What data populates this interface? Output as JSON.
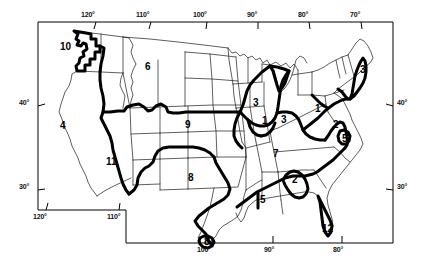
{
  "figure": {
    "kind": "map",
    "projection_note": "conic",
    "colors": {
      "background": "#ffffff",
      "state_outline": "#000000",
      "region_boundary": "#000000",
      "frame": "#000000",
      "text": "#000000"
    }
  },
  "axes": {
    "top_longitude": [
      {
        "label": "120°",
        "x": 92
      },
      {
        "label": "110°",
        "x": 147
      },
      {
        "label": "100°",
        "x": 204
      },
      {
        "label": "90°",
        "x": 254
      },
      {
        "label": "80°",
        "x": 305
      },
      {
        "label": "70°",
        "x": 357
      }
    ],
    "bottom_longitude_upper": [
      {
        "label": "120°",
        "x": 39
      },
      {
        "label": "110°",
        "x": 113
      }
    ],
    "bottom_longitude_lower": [
      {
        "label": "100°",
        "x": 204
      },
      {
        "label": "90°",
        "x": 268
      },
      {
        "label": "80°",
        "x": 337
      }
    ],
    "left_latitude": [
      {
        "label": "40°",
        "y": 103
      },
      {
        "label": "30°",
        "y": 187
      }
    ],
    "right_latitude": [
      {
        "label": "40°",
        "y": 103
      },
      {
        "label": "30°",
        "y": 187
      }
    ]
  },
  "regions": [
    {
      "id": "r10",
      "label": "10",
      "x": 64,
      "y": 48,
      "area": "pacific-northwest"
    },
    {
      "id": "r6",
      "label": "6",
      "x": 148,
      "y": 68,
      "area": "northern-rockies-plains"
    },
    {
      "id": "r4",
      "label": "4",
      "x": 63,
      "y": 127,
      "area": "california-nevada"
    },
    {
      "id": "r11",
      "label": "11",
      "x": 111,
      "y": 163,
      "area": "southwest"
    },
    {
      "id": "r9",
      "label": "9",
      "x": 188,
      "y": 126,
      "area": "central-plains"
    },
    {
      "id": "r8a",
      "label": "8",
      "x": 191,
      "y": 179,
      "area": "southern-plains"
    },
    {
      "id": "r8b",
      "label": "8",
      "x": 207,
      "y": 243,
      "area": "south-texas"
    },
    {
      "id": "r3a",
      "label": "3",
      "x": 256,
      "y": 104,
      "area": "iowa"
    },
    {
      "id": "r1a",
      "label": "1",
      "x": 265,
      "y": 122,
      "area": "illinois"
    },
    {
      "id": "r3b",
      "label": "3",
      "x": 284,
      "y": 121,
      "area": "indiana"
    },
    {
      "id": "r1b",
      "label": "1",
      "x": 318,
      "y": 110,
      "area": "ohio-pennsylvania"
    },
    {
      "id": "r3c",
      "label": "3",
      "x": 363,
      "y": 71,
      "area": "new-england"
    },
    {
      "id": "r2a",
      "label": "2",
      "x": 336,
      "y": 126,
      "area": "virginia"
    },
    {
      "id": "r5a",
      "label": "5",
      "x": 345,
      "y": 140,
      "area": "north-carolina-coast"
    },
    {
      "id": "r7",
      "label": "7",
      "x": 276,
      "y": 155,
      "area": "tennessee-valley"
    },
    {
      "id": "r2b",
      "label": "2",
      "x": 295,
      "y": 181,
      "area": "alabama-georgia"
    },
    {
      "id": "r5b",
      "label": "5",
      "x": 263,
      "y": 201,
      "area": "mississippi"
    },
    {
      "id": "r12",
      "label": "12",
      "x": 328,
      "y": 230,
      "area": "florida"
    }
  ]
}
